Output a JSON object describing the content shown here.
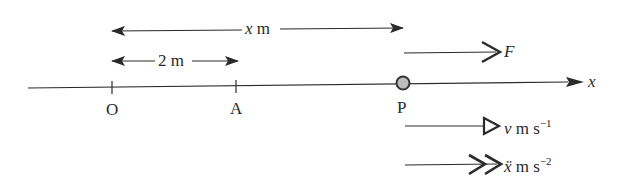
{
  "diagram": {
    "type": "one-dimensional motion on x-axis",
    "axis": {
      "label": "x"
    },
    "points": [
      {
        "id": "O",
        "label": "O",
        "x_px": 112
      },
      {
        "id": "A",
        "label": "A",
        "x_px": 236
      },
      {
        "id": "P",
        "label": "P",
        "x_px": 403
      }
    ],
    "dimensions": [
      {
        "id": "OP",
        "label_var": "x",
        "label_unit": " m",
        "from": "O",
        "to": "P"
      },
      {
        "id": "OA",
        "label_var": "2",
        "label_unit": " m",
        "from": "O",
        "to": "A"
      }
    ],
    "vectors": [
      {
        "id": "force",
        "label": "F",
        "arrowhead": "open-chevron"
      },
      {
        "id": "velocity",
        "label_var": "v",
        "label_unit": " m s",
        "exponent": "−1",
        "arrowhead": "open-triangle"
      },
      {
        "id": "acceleration",
        "label_var": "ẍ",
        "label_unit": " m s",
        "exponent": "−2",
        "arrowhead": "double-chevron"
      }
    ],
    "colors": {
      "line": "#2a2a2a",
      "particle_fill": "#bdbdbd",
      "particle_stroke": "#333333"
    }
  }
}
